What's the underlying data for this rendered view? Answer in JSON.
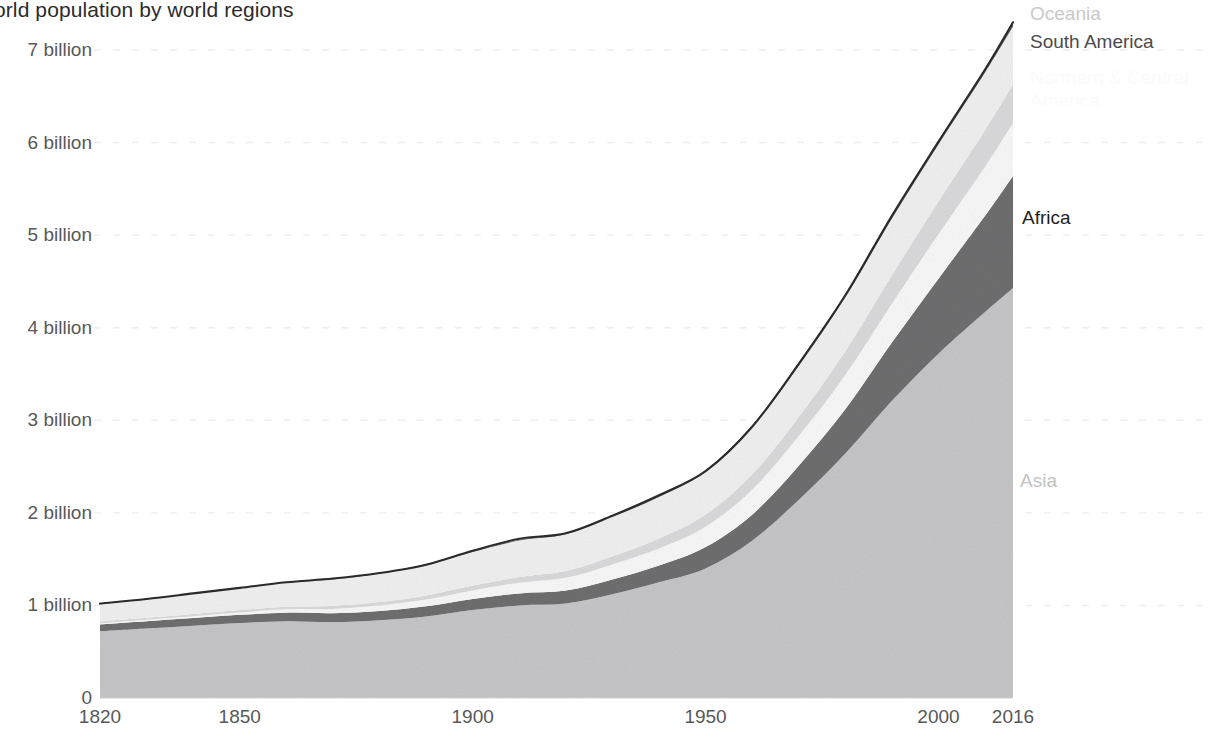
{
  "chart_data": {
    "type": "area",
    "stacked": true,
    "title": "orld population by world regions",
    "title_full": "World population by world regions",
    "xlabel": "",
    "ylabel": "",
    "xlim": [
      1820,
      2016
    ],
    "ylim": [
      0,
      7.4
    ],
    "grid": true,
    "grid_style": "dashed horizontal",
    "legend_position": "right-inline-annotations",
    "x_ticks": [
      1820,
      1850,
      1900,
      1950,
      2000,
      2016
    ],
    "x_tick_labels": [
      "1820",
      "1850",
      "1900",
      "1950",
      "2000",
      "2016"
    ],
    "y_ticks": [
      0,
      1,
      2,
      3,
      4,
      5,
      6,
      7
    ],
    "y_tick_labels": [
      "0",
      "1 billion",
      "2 billion",
      "3 billion",
      "4 billion",
      "5 billion",
      "6 billion",
      "7 billion"
    ],
    "x": [
      1820,
      1830,
      1840,
      1850,
      1860,
      1870,
      1880,
      1890,
      1900,
      1910,
      1920,
      1930,
      1940,
      1950,
      1960,
      1970,
      1980,
      1990,
      2000,
      2010,
      2016
    ],
    "series": [
      {
        "name": "Asia",
        "color": "#c5c5c7",
        "values": [
          0.72,
          0.75,
          0.78,
          0.81,
          0.83,
          0.82,
          0.84,
          0.88,
          0.95,
          1.0,
          1.02,
          1.12,
          1.25,
          1.4,
          1.7,
          2.14,
          2.64,
          3.21,
          3.72,
          4.17,
          4.43
        ]
      },
      {
        "name": "Africa",
        "color": "#6e6e70",
        "values": [
          0.075,
          0.079,
          0.083,
          0.088,
          0.092,
          0.096,
          0.1,
          0.11,
          0.12,
          0.13,
          0.14,
          0.16,
          0.18,
          0.23,
          0.28,
          0.37,
          0.48,
          0.63,
          0.81,
          1.04,
          1.21
        ]
      },
      {
        "name": "Northern & Central America",
        "color": "#f7f7f7",
        "values": [
          0.011,
          0.015,
          0.02,
          0.026,
          0.036,
          0.046,
          0.058,
          0.073,
          0.092,
          0.115,
          0.138,
          0.163,
          0.186,
          0.22,
          0.27,
          0.32,
          0.37,
          0.42,
          0.48,
          0.53,
          0.57
        ]
      },
      {
        "name": "South America",
        "color": "#d9d9db",
        "values": [
          0.02,
          0.022,
          0.024,
          0.026,
          0.029,
          0.033,
          0.038,
          0.044,
          0.052,
          0.062,
          0.073,
          0.088,
          0.107,
          0.131,
          0.164,
          0.206,
          0.256,
          0.308,
          0.354,
          0.396,
          0.42
        ]
      },
      {
        "name": "Europe",
        "color": "#efefef",
        "values": [
          0.192,
          0.205,
          0.222,
          0.241,
          0.262,
          0.285,
          0.31,
          0.335,
          0.364,
          0.394,
          0.398,
          0.424,
          0.448,
          0.466,
          0.513,
          0.55,
          0.582,
          0.609,
          0.615,
          0.622,
          0.625
        ]
      },
      {
        "name": "Oceania",
        "color": "#5c5c5e",
        "values": [
          0.0021,
          0.0022,
          0.0023,
          0.0025,
          0.0033,
          0.0042,
          0.0053,
          0.0066,
          0.008,
          0.0094,
          0.0108,
          0.0122,
          0.0136,
          0.013,
          0.0158,
          0.0199,
          0.0232,
          0.027,
          0.0311,
          0.0368,
          0.04
        ]
      }
    ],
    "totals": [
      1.02,
      1.07,
      1.13,
      1.19,
      1.25,
      1.29,
      1.35,
      1.44,
      1.59,
      1.72,
      1.78,
      1.97,
      2.19,
      2.45,
      2.93,
      3.61,
      4.35,
      5.21,
      6.01,
      6.79,
      7.3
    ],
    "annotations": [
      {
        "label": "Oceania",
        "x": 1030,
        "y": 12
      },
      {
        "label": "South America",
        "x": 1030,
        "y": 40
      },
      {
        "label": "Northern & Central",
        "x": 1030,
        "y": 76
      },
      {
        "label": "America",
        "x": 1030,
        "y": 99
      },
      {
        "label": "Africa",
        "x": 1022,
        "y": 217
      },
      {
        "label": "Asia",
        "x": 1020,
        "y": 480
      }
    ]
  },
  "axis": {
    "y_labels": [
      {
        "text": "7 billion",
        "value": 7
      },
      {
        "text": "6 billion",
        "value": 6
      },
      {
        "text": "5 billion",
        "value": 5
      },
      {
        "text": "4 billion",
        "value": 4
      },
      {
        "text": "3 billion",
        "value": 3
      },
      {
        "text": "2 billion",
        "value": 2
      },
      {
        "text": "1 billion",
        "value": 1
      },
      {
        "text": "0",
        "value": 0
      }
    ],
    "x_labels": [
      {
        "text": "1820",
        "value": 1820
      },
      {
        "text": "1850",
        "value": 1850
      },
      {
        "text": "1900",
        "value": 1900
      },
      {
        "text": "1950",
        "value": 1950
      },
      {
        "text": "2000",
        "value": 2000
      },
      {
        "text": "2016",
        "value": 2016
      }
    ]
  },
  "colors": {
    "asia": "#c5c5c7",
    "africa": "#6e6e70",
    "north_america": "#f7f7f7",
    "south_america": "#d9d9db",
    "europe": "#efefef",
    "oceania": "#5c5c5e",
    "outline": "#2a2a2a",
    "gridline": "#ededee",
    "axis_text": "#58585a",
    "title_text": "#2b2b2b",
    "background": "#ffffff"
  }
}
